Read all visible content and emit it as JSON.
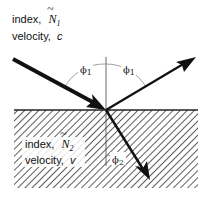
{
  "medium1": {
    "index_label": "index,",
    "index_symbol": "N",
    "index_subscript": "1",
    "velocity_label": "velocity,",
    "velocity_symbol": "c"
  },
  "medium2": {
    "index_label": "index,",
    "index_symbol": "N",
    "index_subscript": "2",
    "velocity_label": "velocity,",
    "velocity_symbol": "v"
  },
  "angles": {
    "incident": {
      "symbol": "ϕ",
      "subscript": "1"
    },
    "reflected": {
      "symbol": "ϕ",
      "subscript": "1"
    },
    "refracted": {
      "symbol": "ϕ",
      "subscript": "2"
    }
  },
  "colors": {
    "ray": "#111111",
    "hatch": "#333333",
    "normal": "#444444",
    "arc": "#888888"
  }
}
